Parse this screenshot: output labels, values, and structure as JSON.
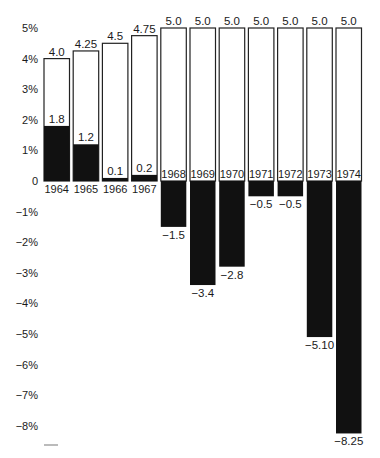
{
  "chart_data": {
    "type": "bar",
    "title": "",
    "xlabel": "",
    "ylabel": "",
    "ylim": [
      -8.5,
      5.2
    ],
    "y_ticks": [
      5,
      4,
      3,
      2,
      1,
      0,
      -1,
      -2,
      -3,
      -4,
      -5,
      -6,
      -7,
      -8
    ],
    "y_tick_labels": [
      "5%",
      "4%",
      "3%",
      "2%",
      "1%",
      "0",
      "−1%",
      "−2%",
      "−3%",
      "−4%",
      "−5%",
      "−6%",
      "−7%",
      "−8%"
    ],
    "grid": false,
    "legend": "none",
    "categories": [
      "1964",
      "1965",
      "1966",
      "1967",
      "1968",
      "1969",
      "1970",
      "1971",
      "1972",
      "1973",
      "1974"
    ],
    "series": [
      {
        "name": "outline",
        "style": "outlined",
        "values": [
          4.0,
          4.25,
          4.5,
          4.75,
          5.0,
          5.0,
          5.0,
          5.0,
          5.0,
          5.0,
          5.0
        ],
        "labels": [
          "4.0",
          "4.25",
          "4.5",
          "4.75",
          "5.0",
          "5.0",
          "5.0",
          "5.0",
          "5.0",
          "5.0",
          "5.0"
        ]
      },
      {
        "name": "solid",
        "style": "filled",
        "values": [
          1.8,
          1.2,
          0.1,
          0.2,
          -1.5,
          -3.4,
          -2.8,
          -0.5,
          -0.5,
          -5.1,
          -8.25
        ],
        "labels": [
          "1.8",
          "1.2",
          "0.1",
          "0.2",
          "−1.5",
          "−3.4",
          "−2.8",
          "−0.5",
          "−0.5",
          "−5.10",
          "−8.25"
        ]
      }
    ],
    "colors": {
      "fill": "#111111",
      "outline": "#222222",
      "background": "#ffffff"
    }
  }
}
